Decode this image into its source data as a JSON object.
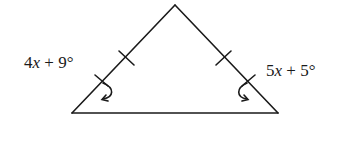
{
  "diagram": {
    "type": "isosceles-triangle",
    "stroke_color": "#1a1a1a",
    "vertices": {
      "apex": [
        175,
        5
      ],
      "base_left": [
        72,
        113
      ],
      "base_right": [
        278,
        113
      ]
    },
    "congruent_sides": [
      "left-leg",
      "right-leg"
    ],
    "angles": {
      "left_base": {
        "coef": "4",
        "var": "x",
        "op": " + ",
        "const": "9°"
      },
      "right_base": {
        "coef": "5",
        "var": "x",
        "op": " + ",
        "const": "5°"
      }
    }
  }
}
